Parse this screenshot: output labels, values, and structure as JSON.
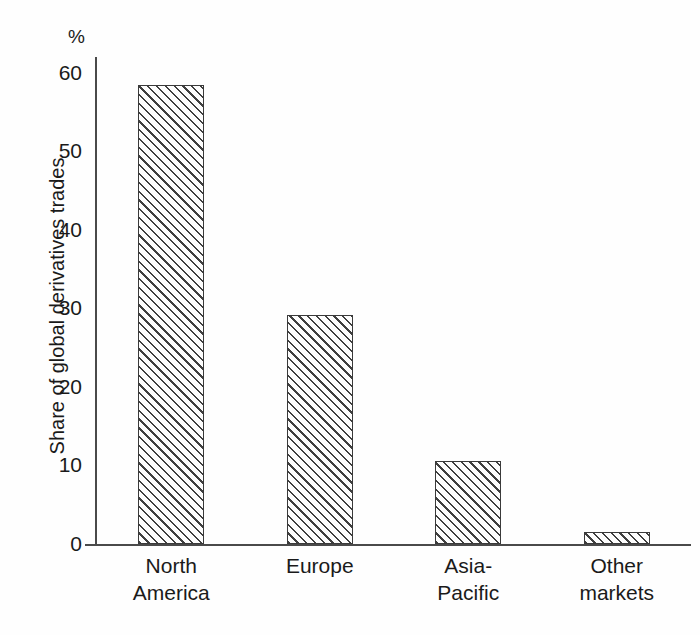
{
  "chart_data": {
    "type": "bar",
    "title": "",
    "subtitle": "",
    "xlabel": "",
    "ylabel": "Share of global derivatives trades",
    "unit_label": "%",
    "categories": [
      "North America",
      "Europe",
      "Asia-Pacific",
      "Other markets"
    ],
    "category_lines": [
      [
        "North",
        "America"
      ],
      [
        "Europe"
      ],
      [
        "Asia-",
        "Pacific"
      ],
      [
        "Other",
        "markets"
      ]
    ],
    "values": [
      58.5,
      29.2,
      10.6,
      1.5
    ],
    "ylim": [
      0,
      62
    ],
    "yticks": [
      0,
      10,
      20,
      30,
      40,
      50,
      60
    ],
    "ytick_labels": [
      "0",
      "10",
      "20",
      "30",
      "40",
      "50",
      "60"
    ],
    "grid": false,
    "legend": false,
    "bar_style": "diagonal-hatch",
    "colors": {
      "hatch": "#3f3f3f",
      "bar_border": "#3a3a3a",
      "bar_fill": "#fdfdfd",
      "axis": "#4a4a4a",
      "text": "#1a1a1a",
      "background": "#fefefe"
    }
  }
}
